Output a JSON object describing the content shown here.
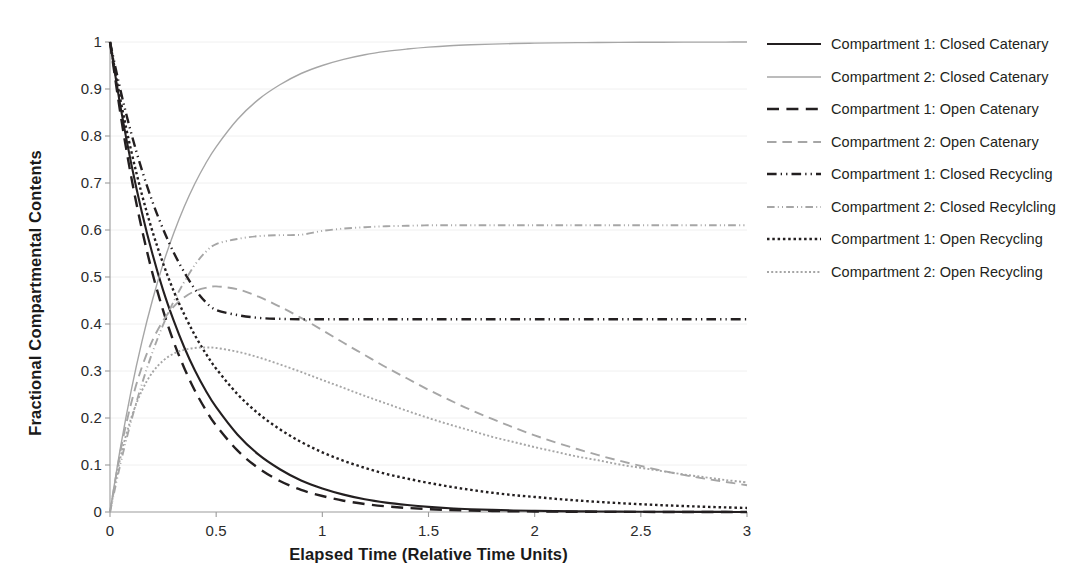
{
  "chart_data": {
    "type": "line",
    "title": "",
    "xlabel": "Elapsed Time (Relative Time Units)",
    "ylabel": "Fractional Compartmental Contents",
    "xlim": [
      0,
      3
    ],
    "ylim": [
      0,
      1
    ],
    "xticks": [
      "0",
      "0.5",
      "1",
      "1.5",
      "2",
      "2.5",
      "3"
    ],
    "xtick_values": [
      0,
      0.5,
      1,
      1.5,
      2,
      2.5,
      3
    ],
    "yticks": [
      "0",
      "0.1",
      "0.2",
      "0.3",
      "0.4",
      "0.5",
      "0.6",
      "0.7",
      "0.8",
      "0.9",
      "1"
    ],
    "ytick_values": [
      0,
      0.1,
      0.2,
      0.3,
      0.4,
      0.5,
      0.6,
      0.7,
      0.8,
      0.9,
      1
    ],
    "grid": "horizontal-light",
    "legend_position": "right",
    "colors": {
      "dark": "#231f20",
      "light": "#a6a6a6"
    },
    "x": [
      0,
      0.05,
      0.1,
      0.15,
      0.2,
      0.25,
      0.3,
      0.35,
      0.4,
      0.45,
      0.5,
      0.6,
      0.7,
      0.8,
      0.9,
      1,
      1.1,
      1.2,
      1.3,
      1.4,
      1.5,
      1.6,
      1.7,
      1.8,
      1.9,
      2,
      2.1,
      2.2,
      2.3,
      2.4,
      2.5,
      2.6,
      2.7,
      2.8,
      2.9,
      3
    ],
    "series": [
      {
        "name": "Compartment 1: Closed Catenary",
        "color": "#231f20",
        "dash": "solid",
        "width": 2.1,
        "values": [
          1,
          0.861,
          0.741,
          0.638,
          0.549,
          0.472,
          0.407,
          0.35,
          0.301,
          0.259,
          0.223,
          0.165,
          0.122,
          0.091,
          0.067,
          0.05,
          0.037,
          0.027,
          0.02,
          0.015,
          0.011,
          0.008,
          0.006,
          0.0045,
          0.0033,
          0.0025,
          0.0018,
          0.0014,
          0.001,
          0.0007,
          0.0006,
          0.0004,
          0.0003,
          0.0002,
          0.00016,
          0.00012
        ]
      },
      {
        "name": "Compartment 2: Closed Catenary",
        "color": "#a6a6a6",
        "dash": "solid",
        "width": 1.4,
        "values": [
          0,
          0.139,
          0.259,
          0.362,
          0.451,
          0.528,
          0.593,
          0.65,
          0.699,
          0.741,
          0.777,
          0.835,
          0.878,
          0.909,
          0.933,
          0.95,
          0.963,
          0.973,
          0.98,
          0.985,
          0.989,
          0.992,
          0.994,
          0.9955,
          0.9967,
          0.9975,
          0.9982,
          0.9986,
          0.999,
          0.9993,
          0.9994,
          0.9996,
          0.9997,
          0.9998,
          0.99984,
          0.99988
        ]
      },
      {
        "name": "Compartment 1: Open Catenary",
        "color": "#231f20",
        "dash": "long-dash",
        "width": 2.4,
        "values": [
          1,
          0.845,
          0.713,
          0.602,
          0.508,
          0.429,
          0.362,
          0.306,
          0.258,
          0.218,
          0.184,
          0.131,
          0.093,
          0.066,
          0.047,
          0.034,
          0.024,
          0.017,
          0.012,
          0.0086,
          0.0061,
          0.0043,
          0.0031,
          0.0022,
          0.0016,
          0.0011,
          0.0008,
          0.00056,
          0.0004,
          0.00028,
          0.0002,
          0.00014,
          0.0001,
          7e-05,
          5e-05,
          4e-05
        ]
      },
      {
        "name": "Compartment 2: Open Catenary",
        "color": "#a6a6a6",
        "dash": "long-dash",
        "width": 1.9,
        "values": [
          0,
          0.131,
          0.232,
          0.308,
          0.365,
          0.407,
          0.437,
          0.457,
          0.47,
          0.477,
          0.48,
          0.474,
          0.458,
          0.437,
          0.413,
          0.387,
          0.36,
          0.334,
          0.308,
          0.284,
          0.26,
          0.238,
          0.217,
          0.198,
          0.18,
          0.163,
          0.148,
          0.134,
          0.121,
          0.109,
          0.098,
          0.088,
          0.079,
          0.071,
          0.064,
          0.057
        ]
      },
      {
        "name": "Compartment 1: Closed Recycling",
        "color": "#231f20",
        "dash": "dash-dot-dot",
        "width": 2.4,
        "values": [
          1,
          0.896,
          0.806,
          0.728,
          0.66,
          0.602,
          0.552,
          0.51,
          0.474,
          0.447,
          0.43,
          0.419,
          0.413,
          0.411,
          0.41,
          0.41,
          0.41,
          0.41,
          0.41,
          0.41,
          0.41,
          0.41,
          0.41,
          0.41,
          0.41,
          0.41,
          0.41,
          0.41,
          0.41,
          0.41,
          0.41,
          0.41,
          0.41,
          0.41,
          0.41,
          0.41
        ]
      },
      {
        "name": "Compartment 2: Closed Recylcling",
        "color": "#a6a6a6",
        "dash": "dash-dot-dot",
        "width": 1.9,
        "values": [
          0,
          0.104,
          0.194,
          0.272,
          0.34,
          0.398,
          0.448,
          0.49,
          0.526,
          0.553,
          0.57,
          0.581,
          0.587,
          0.589,
          0.59,
          0.598,
          0.603,
          0.606,
          0.608,
          0.609,
          0.61,
          0.61,
          0.61,
          0.61,
          0.61,
          0.61,
          0.61,
          0.61,
          0.61,
          0.61,
          0.61,
          0.61,
          0.61,
          0.61,
          0.61,
          0.61
        ]
      },
      {
        "name": "Compartment 1: Open Recycling",
        "color": "#231f20",
        "dash": "dotted",
        "width": 2.4,
        "values": [
          1,
          0.875,
          0.768,
          0.676,
          0.597,
          0.529,
          0.47,
          0.42,
          0.376,
          0.338,
          0.305,
          0.251,
          0.209,
          0.176,
          0.149,
          0.127,
          0.109,
          0.094,
          0.081,
          0.071,
          0.062,
          0.054,
          0.047,
          0.041,
          0.036,
          0.032,
          0.028,
          0.0245,
          0.0215,
          0.0188,
          0.0165,
          0.0145,
          0.0127,
          0.0112,
          0.0098,
          0.0086
        ]
      },
      {
        "name": "Compartment 2: Open Recycling",
        "color": "#a6a6a6",
        "dash": "dotted",
        "width": 1.9,
        "values": [
          0,
          0.118,
          0.2,
          0.258,
          0.297,
          0.322,
          0.337,
          0.345,
          0.349,
          0.35,
          0.349,
          0.341,
          0.329,
          0.314,
          0.298,
          0.281,
          0.264,
          0.247,
          0.231,
          0.215,
          0.2,
          0.186,
          0.173,
          0.16,
          0.149,
          0.138,
          0.128,
          0.118,
          0.11,
          0.101,
          0.094,
          0.087,
          0.08,
          0.074,
          0.068,
          0.063
        ]
      }
    ]
  }
}
